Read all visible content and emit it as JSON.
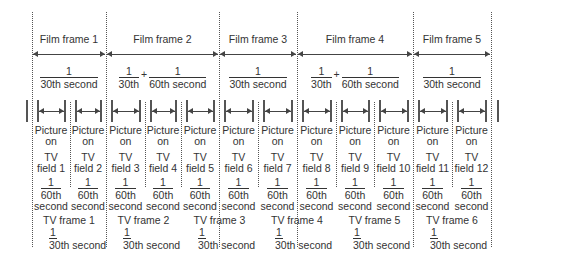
{
  "film_frames": [
    {
      "label": "Film frame 1",
      "duration": {
        "num": "1",
        "den": "30th",
        "suffix": "second"
      },
      "x0": 32,
      "x1": 106
    },
    {
      "label": "Film frame 2",
      "duration": {
        "num": "1",
        "den": "30th",
        "plus": "+",
        "num2": "1",
        "den2": "60th",
        "suffix": "second"
      },
      "x0": 106,
      "x1": 219
    },
    {
      "label": "Film frame 3",
      "duration": {
        "num": "1",
        "den": "30th",
        "suffix": "second"
      },
      "x0": 219,
      "x1": 297
    },
    {
      "label": "Film frame 4",
      "duration": {
        "num": "1",
        "den": "30th",
        "plus": "+",
        "num2": "1",
        "den2": "60th",
        "suffix": "second"
      },
      "x0": 297,
      "x1": 413
    },
    {
      "label": "Film frame 5",
      "duration": {
        "num": "1",
        "den": "30th",
        "suffix": "second"
      },
      "x0": 413,
      "x1": 491
    }
  ],
  "tv_fields": [
    {
      "picture": "Picture",
      "on": "on",
      "tv": "TV",
      "field": "field 1",
      "num": "1",
      "den": "60th",
      "unit": "second"
    },
    {
      "picture": "Picture",
      "on": "on",
      "tv": "TV",
      "field": "field 2",
      "num": "1",
      "den": "60th",
      "unit": "second"
    },
    {
      "picture": "Picture",
      "on": "on",
      "tv": "TV",
      "field": "field 3",
      "num": "1",
      "den": "60th",
      "unit": "second"
    },
    {
      "picture": "Picture",
      "on": "on",
      "tv": "TV",
      "field": "field 4",
      "num": "1",
      "den": "60th",
      "unit": "second"
    },
    {
      "picture": "Picture",
      "on": "on",
      "tv": "TV",
      "field": "field 5",
      "num": "1",
      "den": "60th",
      "unit": "second"
    },
    {
      "picture": "Picture",
      "on": "on",
      "tv": "TV",
      "field": "field 6",
      "num": "1",
      "den": "60th",
      "unit": "second"
    },
    {
      "picture": "Picture",
      "on": "on",
      "tv": "TV",
      "field": "field 7",
      "num": "1",
      "den": "60th",
      "unit": "second"
    },
    {
      "picture": "Picture",
      "on": "on",
      "tv": "TV",
      "field": "field 8",
      "num": "1",
      "den": "60th",
      "unit": "second"
    },
    {
      "picture": "Picture",
      "on": "on",
      "tv": "TV",
      "field": "field 9",
      "num": "1",
      "den": "60th",
      "unit": "second"
    },
    {
      "picture": "Picture",
      "on": "on",
      "tv": "TV",
      "field": "field 10",
      "num": "1",
      "den": "60th",
      "unit": "second"
    },
    {
      "picture": "Picture",
      "on": "on",
      "tv": "TV",
      "field": "field 11",
      "num": "1",
      "den": "60th",
      "unit": "second"
    },
    {
      "picture": "Picture",
      "on": "on",
      "tv": "TV",
      "field": "field 12",
      "num": "1",
      "den": "60th",
      "unit": "second"
    }
  ],
  "tv_frames": [
    {
      "label": "TV frame 1",
      "num": "1",
      "den": "30th second"
    },
    {
      "label": "TV frame 2",
      "num": "1",
      "den": "30th second"
    },
    {
      "label": "TV frame 3",
      "num": "1",
      "den": "30th second"
    },
    {
      "label": "TV frame 4",
      "num": "1",
      "den": "30th second"
    },
    {
      "label": "TV frame 5",
      "num": "1",
      "den": "30th second"
    },
    {
      "label": "TV frame 6",
      "num": "1",
      "den": "30th second"
    }
  ],
  "field_boundaries": [
    32,
    70,
    106,
    145,
    181,
    219,
    258,
    297,
    336,
    374,
    413,
    452,
    491
  ],
  "colors": {
    "line": "#444444",
    "text": "#333333",
    "background": "#ffffff"
  }
}
